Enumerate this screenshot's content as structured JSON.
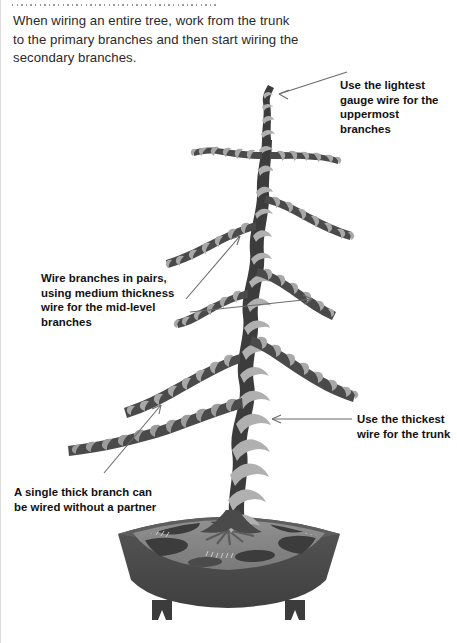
{
  "page": {
    "background_color": "#ffffff"
  },
  "decor": {
    "top_dotted_rule": "dotted-rule",
    "left_margin_rule": "vertical-rule"
  },
  "intro": {
    "text": "When wiring an entire tree, work from the trunk to the primary branches and then start wiring the secondary branches."
  },
  "callouts": [
    {
      "id": "top",
      "text": "Use the lightest gauge wire for the uppermost branches",
      "arrow": "arrow-to-apex"
    },
    {
      "id": "mid",
      "text": "Wire branches in pairs, using medium thickness wire for the mid-level branches",
      "arrow": "two-arrows-to-paired-branches"
    },
    {
      "id": "trunk",
      "text": "Use the thickest wire for the trunk",
      "arrow": "arrow-to-trunk"
    },
    {
      "id": "single",
      "text": "A single thick branch can be wired without a partner",
      "arrow": "arrow-to-single-branch"
    }
  ],
  "illustration": {
    "subject": "bonsai-tree-wired",
    "parts": [
      "apex",
      "upper-branches",
      "mid-branches",
      "lower-branches",
      "single-thick-branch",
      "trunk",
      "root-flare",
      "soil-surface",
      "bonsai-pot",
      "pot-feet"
    ],
    "colors": {
      "branch_dark": "#3c3c3c",
      "branch_mid": "#6e6e6e",
      "wire_light": "#aaaaaa",
      "wire_pale": "#c3c3c3",
      "pot_body": "#4a4a4a",
      "pot_rim": "#595959",
      "soil": "#8a8a8a",
      "soil_dark": "#3f3f3f",
      "leader_line": "#6b6b6b"
    }
  }
}
